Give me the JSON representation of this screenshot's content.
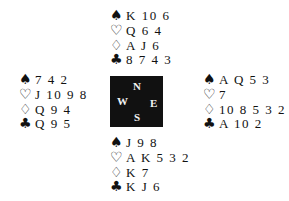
{
  "diagram": {
    "type": "bridge-deal",
    "compass": {
      "north": "N",
      "west": "W",
      "east": "E",
      "south": "S",
      "background": "#111111",
      "text_color": "#f2f2f2"
    },
    "suit_symbols": {
      "spades": "♠",
      "hearts": "♡",
      "diamonds": "♢",
      "clubs": "♣"
    },
    "hands": {
      "north": {
        "spades": "K 10 6",
        "hearts": "Q 6 4",
        "diamonds": "A J 6",
        "clubs": "8 7 4 3"
      },
      "west": {
        "spades": "7 4 2",
        "hearts": "J 10 9 8",
        "diamonds": "Q 9 4",
        "clubs": "Q 9 5"
      },
      "east": {
        "spades": "A Q 5 3",
        "hearts": "7",
        "diamonds": "10 8 5 3 2",
        "clubs": "A 10 2"
      },
      "south": {
        "spades": "J 9 8",
        "hearts": "A K 5 3 2",
        "diamonds": "K 7",
        "clubs": "K J 6"
      }
    }
  }
}
